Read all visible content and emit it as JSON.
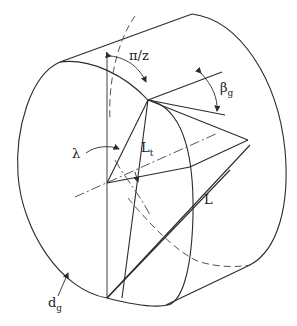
{
  "diagram": {
    "labels": {
      "pi_over_z": "π/z",
      "beta": "β",
      "beta_sub": "g",
      "lambda": "λ",
      "lt": "L",
      "lt_sub": "t",
      "l": "L",
      "dg": "d",
      "dg_sub": "g"
    },
    "colors": {
      "line": "#2b2b2b",
      "dashed": "#555555",
      "background": "#ffffff"
    }
  }
}
